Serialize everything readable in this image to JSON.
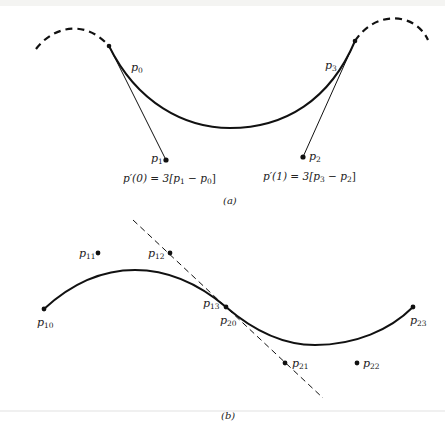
{
  "figure": {
    "panel_a": {
      "caption": "(a)",
      "points": [
        {
          "id": "p0",
          "base": "p",
          "sub": "0",
          "x": 109,
          "y": 46
        },
        {
          "id": "p1",
          "base": "p",
          "sub": "1",
          "x": 166,
          "y": 160
        },
        {
          "id": "p2",
          "base": "p",
          "sub": "2",
          "x": 303,
          "y": 157
        },
        {
          "id": "p3",
          "base": "p",
          "sub": "3",
          "x": 355,
          "y": 41
        }
      ],
      "formula_left": "p′(0) = 3[p₁ − p₀]",
      "formula_right": "p′(1) = 3[p₃ − p₂]"
    },
    "panel_b": {
      "caption": "(b)",
      "points": [
        {
          "id": "p10",
          "base": "p",
          "sub": "10",
          "x": 44,
          "y": 309
        },
        {
          "id": "p11",
          "base": "p",
          "sub": "11",
          "x": 98,
          "y": 253
        },
        {
          "id": "p12",
          "base": "p",
          "sub": "12",
          "x": 170,
          "y": 253
        },
        {
          "id": "p13",
          "base": "p",
          "sub": "13",
          "x": 226,
          "y": 307
        },
        {
          "id": "p20",
          "base": "p",
          "sub": "20",
          "x": 226,
          "y": 307
        },
        {
          "id": "p21",
          "base": "p",
          "sub": "21",
          "x": 285,
          "y": 363
        },
        {
          "id": "p22",
          "base": "p",
          "sub": "22",
          "x": 357,
          "y": 363
        },
        {
          "id": "p23",
          "base": "p",
          "sub": "23",
          "x": 413,
          "y": 307
        }
      ]
    },
    "colors": {
      "ink": "#111111",
      "text": "#222222",
      "background": "#ffffff"
    }
  },
  "labels": {
    "a": {
      "p0": {
        "base": "p",
        "sub": "0"
      },
      "p1": {
        "base": "p",
        "sub": "1"
      },
      "p2": {
        "base": "p",
        "sub": "2"
      },
      "p3": {
        "base": "p",
        "sub": "3"
      },
      "f_left": {
        "lhs": "p′(0) = 3[",
        "p1": "p",
        "s1": "1",
        "mid": " − ",
        "p0": "p",
        "s0": "0",
        "end": "]"
      },
      "f_right": {
        "lhs": "p′(1) = 3[",
        "p3": "p",
        "s3": "3",
        "mid": " − ",
        "p2": "p",
        "s2": "2",
        "end": "]"
      },
      "caption": "(a)"
    },
    "b": {
      "p10": {
        "base": "p",
        "sub": "10"
      },
      "p11": {
        "base": "p",
        "sub": "11"
      },
      "p12": {
        "base": "p",
        "sub": "12"
      },
      "p13": {
        "base": "p",
        "sub": "13"
      },
      "p20": {
        "base": "p",
        "sub": "20"
      },
      "p21": {
        "base": "p",
        "sub": "21"
      },
      "p22": {
        "base": "p",
        "sub": "22"
      },
      "p23": {
        "base": "p",
        "sub": "23"
      },
      "caption": "(b)"
    }
  }
}
